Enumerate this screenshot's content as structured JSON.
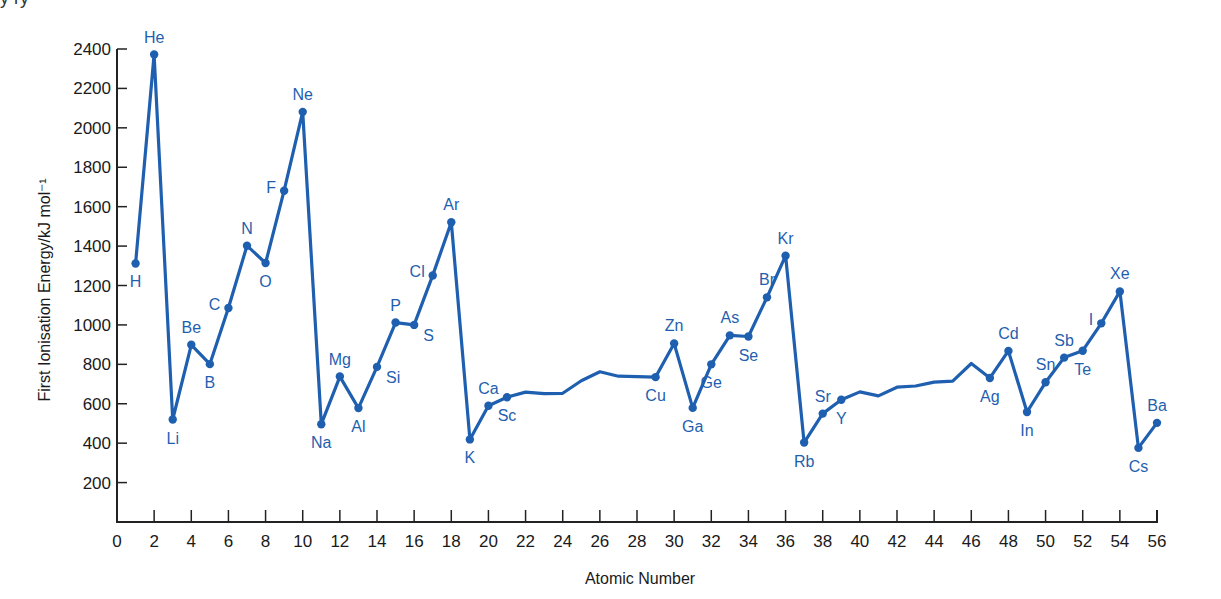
{
  "chart_data": {
    "type": "line",
    "title": "",
    "xlabel": "Atomic Number",
    "ylabel": "First Ionisation Energy/kJ mol⁻¹",
    "xlim": [
      0,
      56
    ],
    "ylim": [
      0,
      2400
    ],
    "x_ticks": [
      0,
      2,
      4,
      6,
      8,
      10,
      12,
      14,
      16,
      18,
      20,
      22,
      24,
      26,
      28,
      30,
      32,
      34,
      36,
      38,
      40,
      42,
      44,
      46,
      48,
      50,
      52,
      54,
      56
    ],
    "y_ticks": [
      200,
      400,
      600,
      800,
      1000,
      1200,
      1400,
      1600,
      1800,
      2000,
      2200,
      2400
    ],
    "grid": false,
    "legend": null,
    "color": "#1f5fb0",
    "series": [
      {
        "name": "First Ionisation Energy",
        "points": [
          {
            "z": 1,
            "v": 1312,
            "label": "H",
            "pos": "below"
          },
          {
            "z": 2,
            "v": 2372,
            "label": "He",
            "pos": "above"
          },
          {
            "z": 3,
            "v": 520,
            "label": "Li",
            "pos": "below"
          },
          {
            "z": 4,
            "v": 899,
            "label": "Be",
            "pos": "above"
          },
          {
            "z": 5,
            "v": 801,
            "label": "B",
            "pos": "below"
          },
          {
            "z": 6,
            "v": 1086,
            "label": "C",
            "pos": "left"
          },
          {
            "z": 7,
            "v": 1402,
            "label": "N",
            "pos": "above"
          },
          {
            "z": 8,
            "v": 1314,
            "label": "O",
            "pos": "below"
          },
          {
            "z": 9,
            "v": 1681,
            "label": "F",
            "pos": "left"
          },
          {
            "z": 10,
            "v": 2081,
            "label": "Ne",
            "pos": "above"
          },
          {
            "z": 11,
            "v": 496,
            "label": "Na",
            "pos": "below"
          },
          {
            "z": 12,
            "v": 738,
            "label": "Mg",
            "pos": "above"
          },
          {
            "z": 13,
            "v": 578,
            "label": "Al",
            "pos": "below"
          },
          {
            "z": 14,
            "v": 787,
            "label": "Si",
            "pos": "right"
          },
          {
            "z": 15,
            "v": 1012,
            "label": "P",
            "pos": "above"
          },
          {
            "z": 16,
            "v": 1000,
            "label": "S",
            "pos": "right"
          },
          {
            "z": 17,
            "v": 1251,
            "label": "Cl",
            "pos": "left"
          },
          {
            "z": 18,
            "v": 1521,
            "label": "Ar",
            "pos": "above"
          },
          {
            "z": 19,
            "v": 419,
            "label": "K",
            "pos": "below"
          },
          {
            "z": 20,
            "v": 590,
            "label": "Ca",
            "pos": "above"
          },
          {
            "z": 21,
            "v": 633,
            "label": "Sc",
            "pos": "below"
          },
          {
            "z": 22,
            "v": 659,
            "label": "",
            "pos": "none"
          },
          {
            "z": 23,
            "v": 651,
            "label": "",
            "pos": "none"
          },
          {
            "z": 24,
            "v": 653,
            "label": "",
            "pos": "none"
          },
          {
            "z": 25,
            "v": 717,
            "label": "",
            "pos": "none"
          },
          {
            "z": 26,
            "v": 762,
            "label": "",
            "pos": "none"
          },
          {
            "z": 27,
            "v": 740,
            "label": "",
            "pos": "none"
          },
          {
            "z": 28,
            "v": 737,
            "label": "",
            "pos": "none"
          },
          {
            "z": 29,
            "v": 735,
            "label": "Cu",
            "pos": "below"
          },
          {
            "z": 30,
            "v": 906,
            "label": "Zn",
            "pos": "above"
          },
          {
            "z": 31,
            "v": 579,
            "label": "Ga",
            "pos": "below"
          },
          {
            "z": 32,
            "v": 800,
            "label": "Ge",
            "pos": "below"
          },
          {
            "z": 33,
            "v": 947,
            "label": "As",
            "pos": "above"
          },
          {
            "z": 34,
            "v": 941,
            "label": "Se",
            "pos": "below"
          },
          {
            "z": 35,
            "v": 1140,
            "label": "Br",
            "pos": "above"
          },
          {
            "z": 36,
            "v": 1351,
            "label": "Kr",
            "pos": "above"
          },
          {
            "z": 37,
            "v": 403,
            "label": "Rb",
            "pos": "below"
          },
          {
            "z": 38,
            "v": 550,
            "label": "Sr",
            "pos": "above"
          },
          {
            "z": 39,
            "v": 620,
            "label": "Y",
            "pos": "below"
          },
          {
            "z": 40,
            "v": 660,
            "label": "",
            "pos": "none"
          },
          {
            "z": 41,
            "v": 640,
            "label": "",
            "pos": "none"
          },
          {
            "z": 42,
            "v": 684,
            "label": "",
            "pos": "none"
          },
          {
            "z": 43,
            "v": 690,
            "label": "",
            "pos": "none"
          },
          {
            "z": 44,
            "v": 710,
            "label": "",
            "pos": "none"
          },
          {
            "z": 45,
            "v": 715,
            "label": "",
            "pos": "none"
          },
          {
            "z": 46,
            "v": 804,
            "label": "",
            "pos": "none"
          },
          {
            "z": 47,
            "v": 731,
            "label": "Ag",
            "pos": "below"
          },
          {
            "z": 48,
            "v": 868,
            "label": "Cd",
            "pos": "above"
          },
          {
            "z": 49,
            "v": 558,
            "label": "In",
            "pos": "below"
          },
          {
            "z": 50,
            "v": 709,
            "label": "Sn",
            "pos": "above"
          },
          {
            "z": 51,
            "v": 834,
            "label": "Sb",
            "pos": "above"
          },
          {
            "z": 52,
            "v": 869,
            "label": "Te",
            "pos": "below"
          },
          {
            "z": 53,
            "v": 1008,
            "label": "I",
            "pos": "left"
          },
          {
            "z": 54,
            "v": 1170,
            "label": "Xe",
            "pos": "above"
          },
          {
            "z": 55,
            "v": 376,
            "label": "Cs",
            "pos": "below"
          },
          {
            "z": 56,
            "v": 503,
            "label": "Ba",
            "pos": "above"
          }
        ]
      }
    ]
  },
  "page": {
    "partial_top_text": "y  ry"
  }
}
